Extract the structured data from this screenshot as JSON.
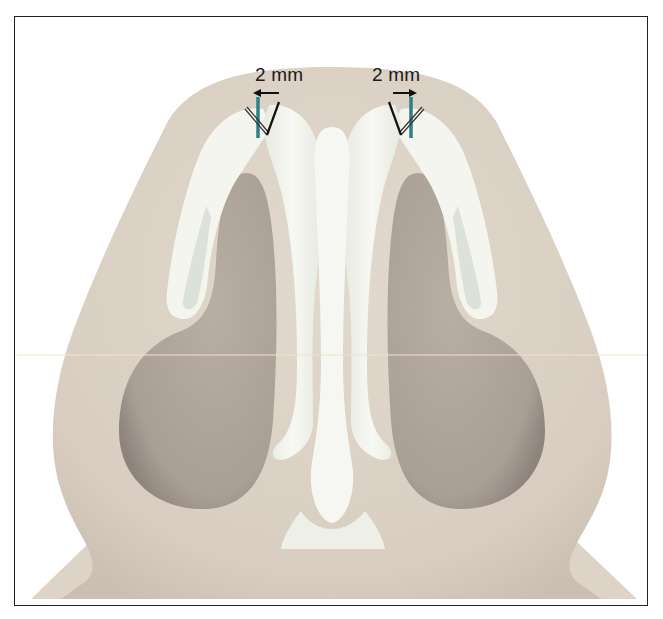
{
  "figure": {
    "type": "anatomical-illustration",
    "annotations": {
      "left": {
        "text": "2 mm",
        "arrow_direction": "left"
      },
      "right": {
        "text": "2 mm",
        "arrow_direction": "right"
      }
    },
    "colors": {
      "skin": "#dcd2c6",
      "skin_shadow": "#c9bcae",
      "nostril": "#b3a89e",
      "nostril_dark": "#9e928a",
      "cartilage": "#f3f4ee",
      "cartilage_shade": "#dfe3da",
      "suture_marker": "#2e7f86",
      "frame": "#222222"
    }
  }
}
